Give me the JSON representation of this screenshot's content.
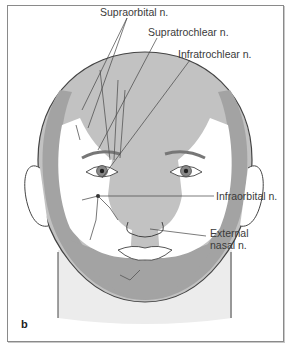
{
  "figure": {
    "panel_letter": "b",
    "colors": {
      "dark_zone": "#a3a3a3",
      "mid_zone": "#c2c2c2",
      "skin": "#ffffff",
      "neck": "#ececec",
      "outline": "#444444",
      "nerve": "#555555",
      "label_text": "#3a3a3a"
    },
    "labels": [
      {
        "text": "Supraorbital n."
      },
      {
        "text": "Supratrochlear n."
      },
      {
        "text": "Infratrochlear n."
      },
      {
        "text": "Infraorbital n."
      },
      {
        "text": "External"
      },
      {
        "text": "nasal n."
      }
    ]
  }
}
